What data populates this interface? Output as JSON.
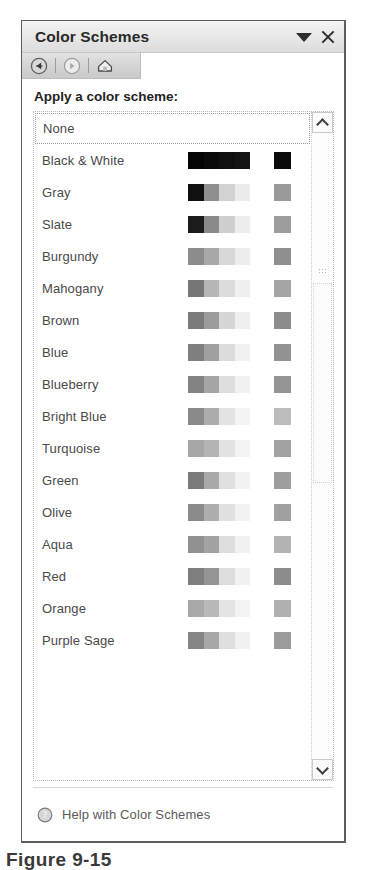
{
  "pane": {
    "title": "Color Schemes",
    "title_actions": [
      {
        "name": "pane-menu-dropdown",
        "icon": "triangle-down-icon"
      },
      {
        "name": "close-pane",
        "icon": "close-icon"
      }
    ],
    "nav_buttons": [
      {
        "label": "Back",
        "icon": "back-arrow-icon"
      },
      {
        "label": "Forward",
        "icon": "forward-arrow-icon"
      },
      {
        "label": "Home",
        "icon": "home-icon"
      }
    ],
    "section_label": "Apply a color scheme:",
    "footer": {
      "help_label": "Help with Color Schemes",
      "help_icon": "help-question-icon"
    }
  },
  "scrollbar": {
    "up_icon": "chevron-up-icon",
    "down_icon": "chevron-down-icon",
    "thumb_grip": "grip-dots-icon"
  },
  "schemes": [
    {
      "label": "None",
      "selected": true,
      "strip": [],
      "single": null
    },
    {
      "label": "Black & White",
      "selected": false,
      "strip": [
        "#050505",
        "#0a0a0a",
        "#101010",
        "#141414"
      ],
      "single": "#0b0b0b"
    },
    {
      "label": "Gray",
      "selected": false,
      "strip": [
        "#101010",
        "#8f8f8f",
        "#d2d2d2",
        "#ececec"
      ],
      "single": "#9a9a9a"
    },
    {
      "label": "Slate",
      "selected": false,
      "strip": [
        "#1b1b1b",
        "#8a8a8a",
        "#cfcfcf",
        "#ededed"
      ],
      "single": "#9d9d9d"
    },
    {
      "label": "Burgundy",
      "selected": false,
      "strip": [
        "#8c8c8c",
        "#a8a8a8",
        "#d8d8d8",
        "#ededed"
      ],
      "single": "#8f8f8f"
    },
    {
      "label": "Mahogany",
      "selected": false,
      "strip": [
        "#767676",
        "#b6b6b6",
        "#dcdcdc",
        "#f0f0f0"
      ],
      "single": "#a5a5a5"
    },
    {
      "label": "Brown",
      "selected": false,
      "strip": [
        "#7b7b7b",
        "#9c9c9c",
        "#d6d6d6",
        "#efefef"
      ],
      "single": "#8c8c8c"
    },
    {
      "label": "Blue",
      "selected": false,
      "strip": [
        "#7f7f7f",
        "#a0a0a0",
        "#dcdcdc",
        "#f1f1f1"
      ],
      "single": "#929292"
    },
    {
      "label": "Blueberry",
      "selected": false,
      "strip": [
        "#838383",
        "#a5a5a5",
        "#dedede",
        "#f1f1f1"
      ],
      "single": "#949494"
    },
    {
      "label": "Bright Blue",
      "selected": false,
      "strip": [
        "#8a8a8a",
        "#acacac",
        "#e3e3e3",
        "#f4f4f4"
      ],
      "single": "#bcbcbc"
    },
    {
      "label": "Turquoise",
      "selected": false,
      "strip": [
        "#a6a6a6",
        "#b4b4b4",
        "#e2e2e2",
        "#f3f3f3"
      ],
      "single": "#a2a2a2"
    },
    {
      "label": "Green",
      "selected": false,
      "strip": [
        "#7a7a7a",
        "#a9a9a9",
        "#e0e0e0",
        "#f2f2f2"
      ],
      "single": "#9e9e9e"
    },
    {
      "label": "Olive",
      "selected": false,
      "strip": [
        "#8b8b8b",
        "#aeaeae",
        "#e1e1e1",
        "#f2f2f2"
      ],
      "single": "#a0a0a0"
    },
    {
      "label": "Aqua",
      "selected": false,
      "strip": [
        "#909090",
        "#a3a3a3",
        "#dedede",
        "#f1f1f1"
      ],
      "single": "#b3b3b3"
    },
    {
      "label": "Red",
      "selected": false,
      "strip": [
        "#7e7e7e",
        "#949494",
        "#dddddd",
        "#f1f1f1"
      ],
      "single": "#8d8d8d"
    },
    {
      "label": "Orange",
      "selected": false,
      "strip": [
        "#a9a9a9",
        "#b9b9b9",
        "#e4e4e4",
        "#f3f3f3"
      ],
      "single": "#b0b0b0"
    },
    {
      "label": "Purple Sage",
      "selected": false,
      "strip": [
        "#858585",
        "#a7a7a7",
        "#dfdfdf",
        "#f1f1f1"
      ],
      "single": "#9b9b9b"
    }
  ],
  "caption": "Figure 9-15"
}
